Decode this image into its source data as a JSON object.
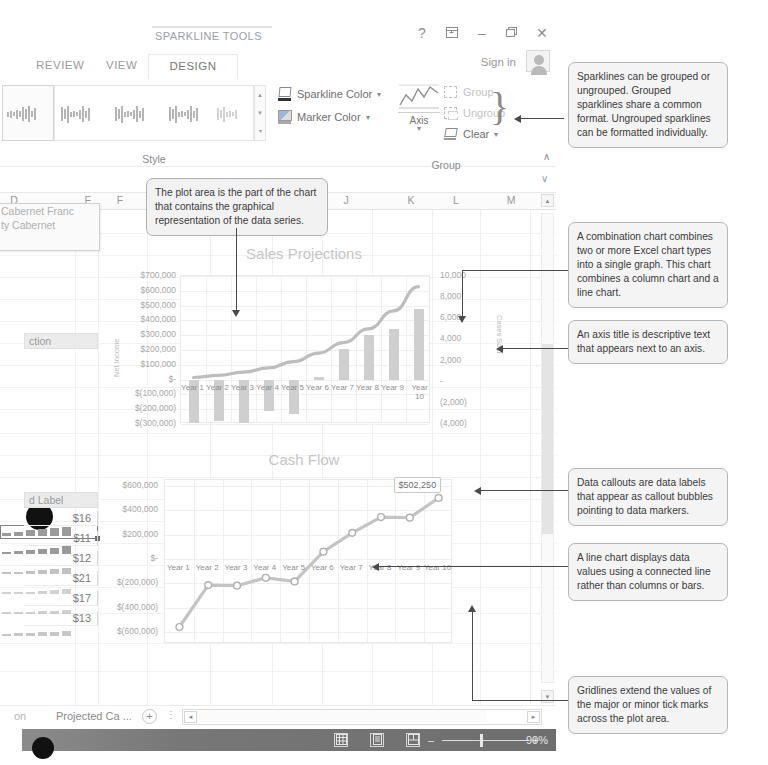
{
  "window": {
    "context_tools_title": "SPARKLINE TOOLS",
    "help_icon": "?",
    "ribbon_display_icon": "ribbon-display-options-icon",
    "minimize_icon": "–",
    "restore_icon": "❐",
    "close_icon": "✕",
    "signin_label": "Sign in"
  },
  "tabs": [
    {
      "label": "REVIEW",
      "active": false
    },
    {
      "label": "VIEW",
      "active": false
    },
    {
      "label": "DESIGN",
      "active": true
    }
  ],
  "ribbon": {
    "groups": [
      {
        "name": "Style",
        "label": "Style"
      },
      {
        "name": "Group",
        "label": "Group"
      }
    ],
    "style_group": {
      "gallery_scroll_up": "▲",
      "gallery_scroll_down": "▼",
      "gallery_more": "▾"
    },
    "commands": [
      {
        "label": "Sparkline Color",
        "icon": "pen-icon",
        "has_dropdown": true,
        "enabled": true
      },
      {
        "label": "Marker Color",
        "icon": "marker-icon",
        "has_dropdown": true,
        "enabled": true
      }
    ],
    "group_group": {
      "axis_label": "Axis",
      "axis_icon": "axis-chart-icon",
      "items": [
        {
          "label": "Group",
          "icon": "group-icon",
          "enabled": false
        },
        {
          "label": "Ungroup",
          "icon": "ungroup-icon",
          "enabled": false
        },
        {
          "label": "Clear",
          "icon": "clear-eraser-icon",
          "enabled": true,
          "has_dropdown": true
        }
      ]
    },
    "collapse_icon": "∧"
  },
  "formula_bar": {
    "expand_icon": "∨"
  },
  "sheet": {
    "column_headers": [
      "D",
      "E",
      "F",
      "J",
      "K",
      "L",
      "M"
    ],
    "name_popup": [
      "Cabernet Franc",
      "ty Cabernet"
    ],
    "section_header": "ction",
    "label_header": "d Label",
    "values": [
      "$16",
      "$11",
      "$12",
      "$21",
      "$17",
      "$13"
    ],
    "scroll_up_icon": "▲",
    "scroll_down_icon": "▼"
  },
  "tabstrip": {
    "sheet_tab": "Projected Ca ...",
    "truncated_tab": "on",
    "add_sheet_icon": "+",
    "tab_menu_icon": "⋮",
    "hscroll_left_icon": "◄",
    "hscroll_right_icon": "►"
  },
  "statusbar": {
    "view_normal_icon": "normal-view-icon",
    "view_pagelayout_icon": "page-layout-view-icon",
    "view_pagebreak_icon": "page-break-view-icon",
    "zoom_out_icon": "–",
    "zoom_in_icon": "+",
    "zoom_level": "90%"
  },
  "notes": [
    {
      "id": "sparkline-group",
      "text": "Sparklines can be grouped or ungrouped. Grouped sparklines share a common format. Ungrouped sparklines can be formatted individually."
    },
    {
      "id": "combination-chart",
      "text": "A combination chart combines two or more Excel chart types into a single graph. This chart combines a column chart and a line chart."
    },
    {
      "id": "axis-title",
      "text": "An axis title is descriptive text that appears next to an axis."
    },
    {
      "id": "data-callout",
      "text": "Data callouts are data labels that appear as callout bubbles pointing to data markers."
    },
    {
      "id": "line-chart",
      "text": "A line chart displays data values using a connected line rather than columns or bars."
    },
    {
      "id": "gridlines",
      "text": "Gridlines extend the values of the major or minor tick marks across the plot area."
    },
    {
      "id": "plot-area",
      "text": "The plot area is the part of the chart that contains the graphical representation of the data series."
    }
  ],
  "chart_data": [
    {
      "id": "sales-projections",
      "type": "bar",
      "title": "Sales Projections",
      "xlabel": "",
      "ylabel": "Net Income",
      "y2label": "Cases Sold",
      "categories": [
        "Year 1",
        "Year 2",
        "Year 3",
        "Year 4",
        "Year 5",
        "Year 6",
        "Year 7",
        "Year 8",
        "Year 9",
        "Year 10"
      ],
      "ytick_labels": [
        "$700,000",
        "$600,000",
        "$500,000",
        "$400,000",
        "$300,000",
        "$200,000",
        "$100,000",
        "$-",
        "$(100,000)",
        "$(200,000)",
        "$(300,000)"
      ],
      "ytick_values": [
        700000,
        600000,
        500000,
        400000,
        300000,
        200000,
        100000,
        0,
        -100000,
        -200000,
        -300000
      ],
      "ylim": [
        -300000,
        700000
      ],
      "y2tick_labels": [
        "10,000",
        "8,000",
        "6,000",
        "4,000",
        "2,000",
        "-",
        "(2,000)",
        "(4,000)"
      ],
      "y2tick_values": [
        10000,
        8000,
        6000,
        4000,
        2000,
        0,
        -2000,
        -4000
      ],
      "y2lim": [
        -4000,
        10000
      ],
      "grid": true,
      "legend": "none",
      "series": [
        {
          "name": "Net Income",
          "chart_type": "column",
          "axis": "primary",
          "values": [
            -290000,
            -280000,
            -290000,
            -210000,
            -230000,
            15000,
            210000,
            300000,
            340000,
            480000
          ]
        },
        {
          "name": "Cases Sold",
          "chart_type": "line",
          "axis": "secondary",
          "smooth": true,
          "values": [
            400,
            600,
            900,
            1300,
            1900,
            2700,
            3700,
            5000,
            6700,
            9000
          ]
        }
      ]
    },
    {
      "id": "cash-flow",
      "type": "line",
      "title": "Cash Flow",
      "xlabel": "",
      "ylabel": "",
      "categories": [
        "Year 1",
        "Year 2",
        "Year 3",
        "Year 4",
        "Year 5",
        "Year 6",
        "Year 7",
        "Year 8",
        "Year 9",
        "Year 10"
      ],
      "ytick_labels": [
        "$600,000",
        "$400,000",
        "$200,000",
        "$-",
        "$(200,000)",
        "$(400,000)",
        "$(600,000)"
      ],
      "ytick_values": [
        600000,
        400000,
        200000,
        0,
        -200000,
        -400000,
        -600000
      ],
      "ylim": [
        -700000,
        650000
      ],
      "grid": true,
      "legend": "none",
      "data_callout": {
        "label": "$502,250",
        "attached_to": "Year 10"
      },
      "series": [
        {
          "name": "Cash Flow",
          "chart_type": "line",
          "markers": true,
          "values": [
            -560000,
            -215000,
            -220000,
            -155000,
            -185000,
            60000,
            215000,
            345000,
            340000,
            502250
          ]
        }
      ]
    }
  ]
}
